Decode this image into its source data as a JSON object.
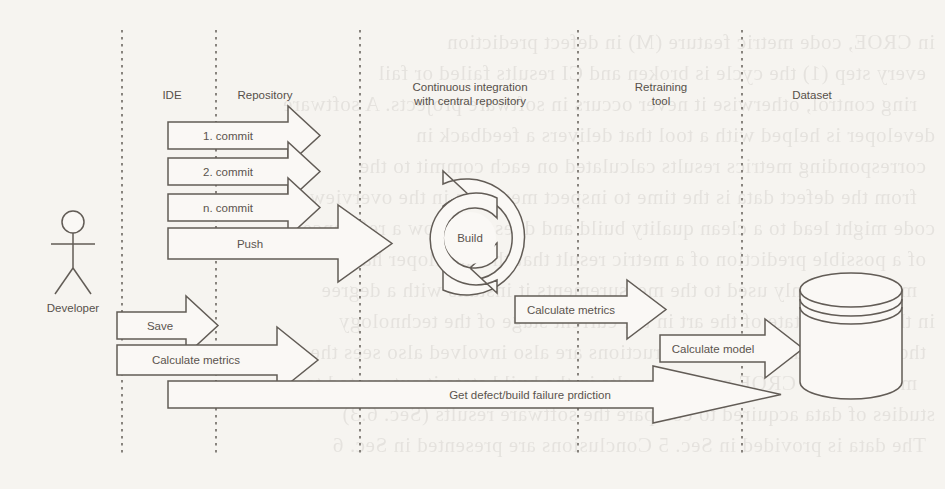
{
  "diagram": {
    "type": "uml-sequence",
    "background_color": "#f6f4f0",
    "line_color": "#625c56",
    "text_color": "#57514c"
  },
  "actor": {
    "name": "Developer",
    "label": "Developer",
    "icon": "stick-figure-actor"
  },
  "lifelines": [
    {
      "id": "developer",
      "label": "Developer",
      "x": 122
    },
    {
      "id": "ide",
      "label": "IDE",
      "x": 216
    },
    {
      "id": "repository",
      "label": "Repository",
      "x": 360
    },
    {
      "id": "ci",
      "label": "Continuous integration with central repository",
      "x": 578
    },
    {
      "id": "retraining",
      "label": "Retraining tool",
      "x": 742
    },
    {
      "id": "dataset",
      "label": "Dataset",
      "x": 862
    }
  ],
  "headers": [
    {
      "id": "ide",
      "label": "IDE",
      "line1": "IDE",
      "line2": ""
    },
    {
      "id": "repository",
      "label": "Repository",
      "line1": "Repository",
      "line2": ""
    },
    {
      "id": "ci",
      "label": "Continuous integration with central repository",
      "line1": "Continuous integration",
      "line2": "with central repository"
    },
    {
      "id": "retraining",
      "label": "Retraining tool",
      "line1": "Retraining",
      "line2": "tool"
    },
    {
      "id": "dataset",
      "label": "Dataset",
      "line1": "Dataset",
      "line2": ""
    }
  ],
  "messages": [
    {
      "id": "commit-1",
      "label": "1. commit",
      "from": "ide",
      "to": "repository",
      "direction": "right"
    },
    {
      "id": "commit-2",
      "label": "2. commit",
      "from": "ide",
      "to": "repository",
      "direction": "right"
    },
    {
      "id": "commit-n",
      "label": "n. commit",
      "from": "ide",
      "to": "repository",
      "direction": "right"
    },
    {
      "id": "push",
      "label": "Push",
      "from": "ide",
      "to": "ci",
      "direction": "right"
    },
    {
      "id": "save",
      "label": "Save",
      "from": "developer",
      "to": "ide",
      "direction": "right"
    },
    {
      "id": "calculate-metrics-left",
      "label": "Calculate metrics",
      "from": "developer",
      "to": "repository",
      "direction": "right"
    },
    {
      "id": "calculate-metrics-right",
      "label": "Calculate metrics",
      "from": "ci",
      "to": "retraining",
      "direction": "right"
    },
    {
      "id": "calculate-model",
      "label": "Calculate model",
      "from": "retraining",
      "to": "dataset",
      "direction": "right"
    },
    {
      "id": "get-prediction",
      "label": "Get defect/build failure prdiction",
      "from": "repository",
      "to": "dataset",
      "direction": "right"
    }
  ],
  "build_node": {
    "label": "Build",
    "icon": "circular-refresh-cycle-icon"
  },
  "dataset_node": {
    "label": "Dataset",
    "icon": "database-cylinder-icon"
  },
  "background_text": {
    "description": "faint mirrored bleed-through text from reverse of scanned page",
    "lines": [
      "in CROE, code metric feature (M) in defect prediction",
      "every step (1) the cycle is broken and CI results failed or fail",
      "ring control, otherwise it never occurs in software projects. A software",
      "developer is helped with a tool that delivers a feedback in",
      "corresponding metrics results calculated on each commit to the",
      "from the defect data is the time to inspect measures in the overview",
      "code might lead to a clean quality build and does not show a reference",
      "of a possible prediction of a metric result that the developer has",
      "most commonly used to the measurements it installs with a degree",
      "in the current state of the art in the current stage of the technology",
      "thorough research for the instructions are also involved also sees the observed",
      "measures for CROE metrics results in the build state it automated to",
      "studies of data acquired to compare the software results (Sec. 6.3)",
      "The data is provided in Sec. 5 Conclusions are presented in Sec. 6"
    ]
  }
}
